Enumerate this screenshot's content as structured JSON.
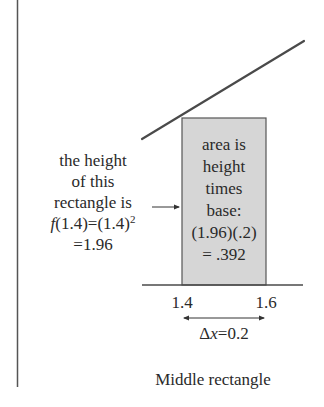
{
  "diagram": {
    "type": "riemann-sum-middle-rectangle",
    "colors": {
      "stroke": "#4a4a4a",
      "rect_fill": "#d6d6d6",
      "rect_stroke": "#555555",
      "text": "#2a2a2a"
    },
    "left_annotation": {
      "line1": "the height",
      "line2": "of this",
      "line3": "rectangle is",
      "line4_func": "f",
      "line4_rest": "(1.4)=(1.4)",
      "line4_sup": "2",
      "line5": "=1.96"
    },
    "box_annotation": {
      "line1": "area is",
      "line2": "height",
      "line3": "times",
      "line4": "base:",
      "line5": "(1.96)(.2)",
      "line6": "= .392"
    },
    "axis": {
      "tick_left": "1.4",
      "tick_right": "1.6",
      "delta_symbol": "Δ",
      "delta_var": "x",
      "delta_value": "=0.2"
    },
    "caption": "Middle rectangle"
  }
}
